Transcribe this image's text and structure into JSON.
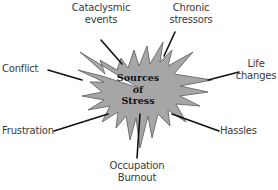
{
  "diagram": {
    "center": {
      "lines": [
        "Sources",
        "of",
        "Stress"
      ],
      "fill_color": "#a6a6a6",
      "stroke_color": "#555555"
    },
    "connector_color": "#111111",
    "nodes": [
      {
        "id": "cataclysmic",
        "lines": [
          "Cataclysmic",
          "events"
        ]
      },
      {
        "id": "chronic",
        "lines": [
          "Chronic",
          "stressors"
        ]
      },
      {
        "id": "life",
        "lines": [
          "Life",
          "changes"
        ]
      },
      {
        "id": "conflict",
        "lines": [
          "Conflict"
        ]
      },
      {
        "id": "frustration",
        "lines": [
          "Frustration"
        ]
      },
      {
        "id": "hassles",
        "lines": [
          "Hassles"
        ]
      },
      {
        "id": "occupation",
        "lines": [
          "Occupation",
          "Burnout"
        ]
      }
    ]
  }
}
